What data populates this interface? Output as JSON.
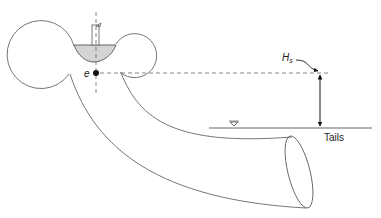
{
  "diagram": {
    "labels": {
      "elevation_point": "e",
      "suction_head": "H",
      "suction_head_subscript": "s",
      "tailwater": "Tails",
      "water_surface_symbol": "▽"
    },
    "colors": {
      "stroke": "#555555",
      "runner_fill": "#d4d4d4",
      "dashed": "#666666",
      "arrow": "#111111",
      "point": "#111111"
    },
    "components": [
      "spiral-casing",
      "runner",
      "shaft",
      "centerline",
      "draft-tube",
      "tailwater-line",
      "suction-head-dimension"
    ]
  }
}
